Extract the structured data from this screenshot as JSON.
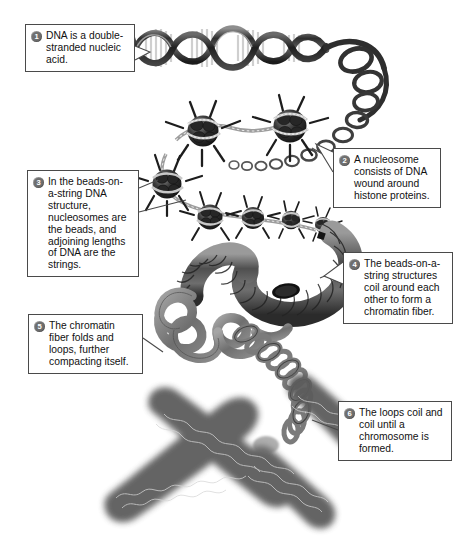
{
  "figure": {
    "background_color": "#ffffff",
    "ink_color": "#4a4a4a",
    "badge_color": "#6e6e6e"
  },
  "callouts": [
    {
      "number": "1",
      "text": "DNA is a double-stranded nucleic acid.",
      "name": "callout-dna"
    },
    {
      "number": "2",
      "text": "A nucleosome consists of DNA wound around histone proteins.",
      "name": "callout-nucleosome"
    },
    {
      "number": "3",
      "text": "In the beads-on-a-string DNA structure, nucleosomes are the beads, and adjoining lengths of DNA are the strings.",
      "name": "callout-beads-on-a-string"
    },
    {
      "number": "4",
      "text": "The beads-on-a-string structures coil around each other to form a chromatin fiber.",
      "name": "callout-chromatin-fiber"
    },
    {
      "number": "5",
      "text": "The chromatin fiber folds and loops, further compacting itself.",
      "name": "callout-folding-looping"
    },
    {
      "number": "6",
      "text": "The loops coil and coil until a chromosome is formed.",
      "name": "callout-chromosome"
    }
  ],
  "structures": [
    {
      "name": "dna-double-helix",
      "label": "DNA double helix"
    },
    {
      "name": "nucleosome-beads",
      "label": "Nucleosomes (beads on a string)"
    },
    {
      "name": "chromatin-fiber",
      "label": "Chromatin fiber"
    },
    {
      "name": "looped-fiber",
      "label": "Folded and looped chromatin"
    },
    {
      "name": "chromosome",
      "label": "Condensed chromosome"
    }
  ]
}
